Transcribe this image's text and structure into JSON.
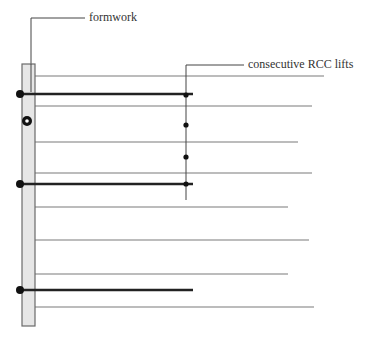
{
  "labels": {
    "formwork": "formwork",
    "rcc_lifts": "consecutive RCC lifts"
  },
  "colors": {
    "thin_line": "#7a7a7a",
    "thick_line": "#222222",
    "formwork_fill": "#e6e6e6",
    "formwork_stroke": "#6a6a6a",
    "dot": "#111111"
  },
  "formwork": {
    "x": 22,
    "y": 64,
    "width": 13,
    "height": 262
  },
  "lift_lines": [
    {
      "y": 76,
      "x2": 324
    },
    {
      "y": 106,
      "x2": 312
    },
    {
      "y": 142,
      "x2": 298
    },
    {
      "y": 173,
      "x2": 312
    },
    {
      "y": 207,
      "x2": 288
    },
    {
      "y": 240,
      "x2": 309
    },
    {
      "y": 274,
      "x2": 288
    },
    {
      "y": 307,
      "x2": 314
    }
  ],
  "tie_rods": [
    {
      "y": 94,
      "x2": 193
    },
    {
      "y": 184,
      "x2": 193
    },
    {
      "y": 290,
      "x2": 193
    }
  ],
  "rcc_markers_y": [
    95,
    125,
    157,
    184
  ]
}
